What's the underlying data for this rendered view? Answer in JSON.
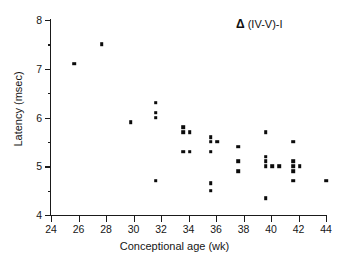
{
  "chart_data": {
    "type": "scatter",
    "title": "",
    "annotation": "Δ (IV-V)-I",
    "annotation_symbol": "Δ",
    "annotation_text": "(IV-V)-I",
    "xlabel": "Conceptional age (wk)",
    "ylabel": "Latency (msec)",
    "xlim": [
      24,
      44
    ],
    "ylim": [
      4,
      8
    ],
    "xticks": [
      24,
      26,
      28,
      30,
      32,
      34,
      36,
      38,
      40,
      42,
      44
    ],
    "xtick_labels": [
      "24",
      "26",
      "28",
      "30",
      "32",
      "34",
      "36",
      "38",
      "40",
      "42",
      "44"
    ],
    "yticks": [
      4,
      5,
      6,
      7,
      8
    ],
    "ytick_labels": [
      "4",
      "5",
      "6",
      "7",
      "8"
    ],
    "yticks_minor": [
      4.5,
      5.5,
      6.5,
      7.5
    ],
    "grid": false,
    "legend": false,
    "marker": "square",
    "marker_color": "#0b0b0b",
    "points": [
      {
        "x": 25.7,
        "y": 7.1
      },
      {
        "x": 27.7,
        "y": 7.5
      },
      {
        "x": 29.8,
        "y": 5.9
      },
      {
        "x": 31.6,
        "y": 6.3
      },
      {
        "x": 31.6,
        "y": 6.1
      },
      {
        "x": 31.6,
        "y": 6.0
      },
      {
        "x": 31.6,
        "y": 4.7
      },
      {
        "x": 33.6,
        "y": 5.8
      },
      {
        "x": 33.6,
        "y": 5.7
      },
      {
        "x": 34.1,
        "y": 5.7
      },
      {
        "x": 33.6,
        "y": 5.3
      },
      {
        "x": 34.1,
        "y": 5.3
      },
      {
        "x": 35.6,
        "y": 5.6
      },
      {
        "x": 35.6,
        "y": 5.5
      },
      {
        "x": 36.1,
        "y": 5.5
      },
      {
        "x": 35.6,
        "y": 5.3
      },
      {
        "x": 35.6,
        "y": 4.65
      },
      {
        "x": 35.6,
        "y": 4.5
      },
      {
        "x": 37.6,
        "y": 5.4
      },
      {
        "x": 37.6,
        "y": 5.1
      },
      {
        "x": 37.6,
        "y": 4.9
      },
      {
        "x": 39.6,
        "y": 5.7
      },
      {
        "x": 39.6,
        "y": 5.2
      },
      {
        "x": 39.6,
        "y": 5.1
      },
      {
        "x": 39.6,
        "y": 5.0
      },
      {
        "x": 40.1,
        "y": 5.0
      },
      {
        "x": 40.6,
        "y": 5.0
      },
      {
        "x": 39.6,
        "y": 4.35
      },
      {
        "x": 41.6,
        "y": 5.5
      },
      {
        "x": 41.6,
        "y": 5.1
      },
      {
        "x": 41.6,
        "y": 5.0
      },
      {
        "x": 42.1,
        "y": 5.0
      },
      {
        "x": 41.6,
        "y": 4.9
      },
      {
        "x": 41.6,
        "y": 4.7
      },
      {
        "x": 44.0,
        "y": 4.7
      }
    ]
  }
}
